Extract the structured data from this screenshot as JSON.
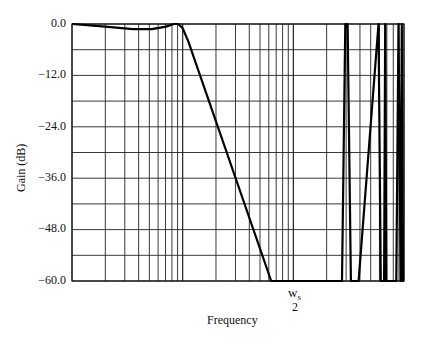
{
  "chart_data": {
    "type": "line",
    "title": "",
    "xlabel": "Frequency",
    "ylabel": "Gain (dB)",
    "xscale": "log",
    "x_decades": 3,
    "ylim": [
      -60.0,
      0.0
    ],
    "y_ticks": [
      "0.0",
      "-12.0",
      "-24.0",
      "-36.0",
      "-48.0",
      "-60.0"
    ],
    "y_minor_step": 6,
    "grid": true,
    "annotation": {
      "numerator": "w",
      "subscript": "s",
      "denominator": "2",
      "x_position_decade": 2.0
    },
    "series": [
      {
        "name": "Gain",
        "x_decade_units": [
          0.0,
          0.3,
          0.55,
          0.72,
          0.85,
          0.92,
          0.96,
          1.0,
          1.05,
          1.8,
          2.44,
          2.47,
          2.48,
          2.49,
          2.52,
          2.59,
          2.77,
          2.79,
          2.82,
          2.83,
          2.84,
          2.93,
          2.95,
          2.97,
          2.98,
          2.99,
          3.0
        ],
        "values": [
          0.0,
          -0.6,
          -1.2,
          -1.2,
          -0.6,
          0.0,
          0.0,
          -1.0,
          -4.0,
          -60.0,
          -60.0,
          0.0,
          -0.6,
          0.0,
          -60.0,
          -60.0,
          0.0,
          -60.0,
          -60.0,
          0.0,
          -60.0,
          -60.0,
          0.0,
          -60.0,
          0.0,
          -60.0,
          -60.0
        ]
      }
    ]
  },
  "labels": {
    "y_axis": "Gain (dB)",
    "x_axis": "Frequency",
    "ws_num": "w",
    "ws_sub": "s",
    "ws_den": "2",
    "ticks": [
      "0.0",
      "−12.0",
      "−24.0",
      "−36.0",
      "−48.0",
      "−60.0"
    ]
  }
}
